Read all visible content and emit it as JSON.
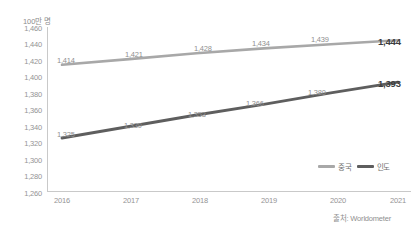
{
  "chart_data": {
    "type": "line",
    "title": "",
    "unit_label": "100만 명",
    "xlabel": "",
    "ylabel": "",
    "x": [
      "2016",
      "2017",
      "2018",
      "2019",
      "2020",
      "2021"
    ],
    "categories": [
      "2016",
      "2017",
      "2018",
      "2019",
      "2020",
      "2021"
    ],
    "ylim": [
      1260,
      1460
    ],
    "yticks": [
      "1,460",
      "1,440",
      "1,420",
      "1,400",
      "1,380",
      "1,360",
      "1,340",
      "1,320",
      "1,300",
      "1,280",
      "1,260"
    ],
    "ytick_values": [
      1460,
      1440,
      1420,
      1400,
      1380,
      1360,
      1340,
      1320,
      1300,
      1280,
      1260
    ],
    "grid": false,
    "legend_position": "bottom-right-inside",
    "series": [
      {
        "name": "중국",
        "color": "#a8a8a8",
        "values": [
          1414,
          1421,
          1428,
          1434,
          1439,
          1444
        ],
        "labels": [
          "1,414",
          "1,421",
          "1,428",
          "1,434",
          "1,439",
          "1,444"
        ]
      },
      {
        "name": "인도",
        "color": "#5e5e5e",
        "values": [
          1325,
          1339,
          1353,
          1366,
          1380,
          1393
        ],
        "labels": [
          "1,325",
          "1,339",
          "1,353",
          "1,366",
          "1,380",
          "1,393"
        ]
      }
    ],
    "source_note": "출처: Worldometer"
  },
  "legend": {
    "items": [
      {
        "label": "중국",
        "color": "#a8a8a8"
      },
      {
        "label": "인도",
        "color": "#5e5e5e"
      }
    ]
  },
  "source": {
    "text": "출처: Worldometer"
  },
  "axis": {
    "unit": "100만 명"
  }
}
